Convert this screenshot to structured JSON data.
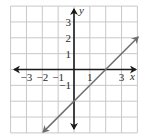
{
  "chart_data": {
    "type": "line",
    "title": "",
    "xlabel": "x",
    "ylabel": "y",
    "xlim": [
      -4,
      4
    ],
    "ylim": [
      -4,
      4
    ],
    "grid": true,
    "x_tick_labels": [
      {
        "value": -3,
        "label": "−3"
      },
      {
        "value": -2,
        "label": "−2"
      },
      {
        "value": -1,
        "label": "−1"
      },
      {
        "value": 1,
        "label": "1"
      },
      {
        "value": 3,
        "label": "3"
      }
    ],
    "y_tick_labels": [
      {
        "value": 3,
        "label": "3"
      },
      {
        "value": 2,
        "label": "2"
      },
      {
        "value": 1,
        "label": "1"
      },
      {
        "value": -1,
        "label": "−1"
      }
    ],
    "series": [
      {
        "name": "y = x - 2",
        "slope": 1,
        "intercept": -2,
        "x": [
          -1.95,
          4.05
        ],
        "y": [
          -3.95,
          2.05
        ],
        "arrows_both_ends": true,
        "color": "#6e6e6e"
      }
    ]
  },
  "colors": {
    "grid": "#c8c8c8",
    "axis": "#1a1a1a",
    "line": "#6e6e6e"
  }
}
